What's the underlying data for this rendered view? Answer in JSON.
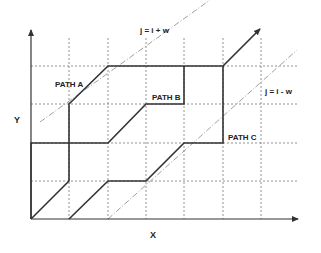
{
  "diagram": {
    "type": "warping-path-grid",
    "axes": {
      "x_label": "X",
      "y_label": "Y"
    },
    "grid": {
      "columns": 7,
      "rows": 5,
      "style": "dotted"
    },
    "band_lines": [
      {
        "label": "j = i + w",
        "style": "dash-dot"
      },
      {
        "label": "j = i - w",
        "style": "dash-dot"
      }
    ],
    "paths": [
      {
        "label": "PATH A"
      },
      {
        "label": "PATH B"
      },
      {
        "label": "PATH C"
      }
    ],
    "colors": {
      "path": "#333333",
      "grid": "#666666",
      "band": "#888888",
      "axis": "#333333"
    }
  }
}
